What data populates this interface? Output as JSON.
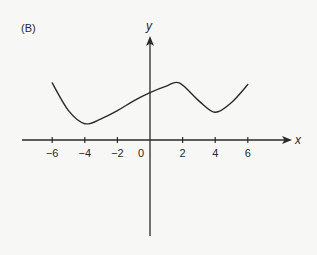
{
  "panel_label": "(B)",
  "chart_data": {
    "type": "line",
    "title": "",
    "panel_label": "(B)",
    "xlabel": "x",
    "ylabel": "y",
    "x_ticks": [
      -6,
      -4,
      -2,
      0,
      2,
      4,
      6
    ],
    "x_tick_labels": [
      "−6",
      "−4",
      "−2",
      "0",
      "2",
      "4",
      "6"
    ],
    "y_ticks": [],
    "xlim": [
      -7.9,
      8.7
    ],
    "ylim": [
      -5.9,
      6.5
    ],
    "grid": false,
    "legend": null,
    "series": [
      {
        "name": "f(x)",
        "x": [
          -6,
          -5,
          -4,
          -3,
          -2,
          -1,
          0,
          1,
          1.8,
          3,
          4,
          5,
          6
        ],
        "y": [
          3.5,
          1.8,
          1.0,
          1.3,
          1.8,
          2.4,
          2.9,
          3.3,
          3.5,
          2.4,
          1.7,
          2.3,
          3.4
        ]
      }
    ],
    "annotations": [
      "Local minimum near x = -4",
      "Local maximum near x = 2",
      "Local minimum near x = 4"
    ]
  },
  "colors": {
    "background": "#f7f7f5",
    "ink": "#2a2a2a"
  }
}
